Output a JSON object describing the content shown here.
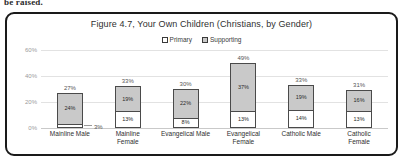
{
  "page": {
    "text_fragment": "be raised."
  },
  "figure": {
    "title": "Figure 4.7, Your Own Children (Christians, by Gender)"
  },
  "legend": {
    "items": [
      {
        "label": "Primary",
        "color": "#ffffff",
        "swatch": "primary"
      },
      {
        "label": "Supporting",
        "color": "#c9c9c9",
        "swatch": "supporting"
      }
    ]
  },
  "chart_data": {
    "type": "bar",
    "subtype": "stacked-column",
    "title": "Figure 4.7, Your Own Children (Christians, by Gender)",
    "xlabel": "",
    "ylabel": "",
    "ylim": [
      0,
      60
    ],
    "yticks": [
      "0%",
      "20%",
      "40%",
      "60%"
    ],
    "grid": true,
    "legend_position": "top-center",
    "categories": [
      "Mainline Male",
      "Mainline Female",
      "Evangelical Male",
      "Evangelical Female",
      "Catholic Male",
      "Catholic Female"
    ],
    "series": [
      {
        "name": "Primary",
        "color": "#ffffff",
        "values": [
          3,
          13,
          8,
          13,
          14,
          13
        ],
        "labels": [
          "3%",
          "13%",
          "8%",
          "13%",
          "14%",
          "13%"
        ]
      },
      {
        "name": "Supporting",
        "color": "#c9c9c9",
        "values": [
          24,
          19,
          22,
          37,
          19,
          16
        ],
        "labels": [
          "24%",
          "19%",
          "22%",
          "37%",
          "19%",
          "16%"
        ]
      }
    ],
    "totals": [
      27,
      33,
      30,
      49,
      33,
      31
    ],
    "total_labels": [
      "27%",
      "33%",
      "30%",
      "49%",
      "33%",
      "31%"
    ]
  }
}
